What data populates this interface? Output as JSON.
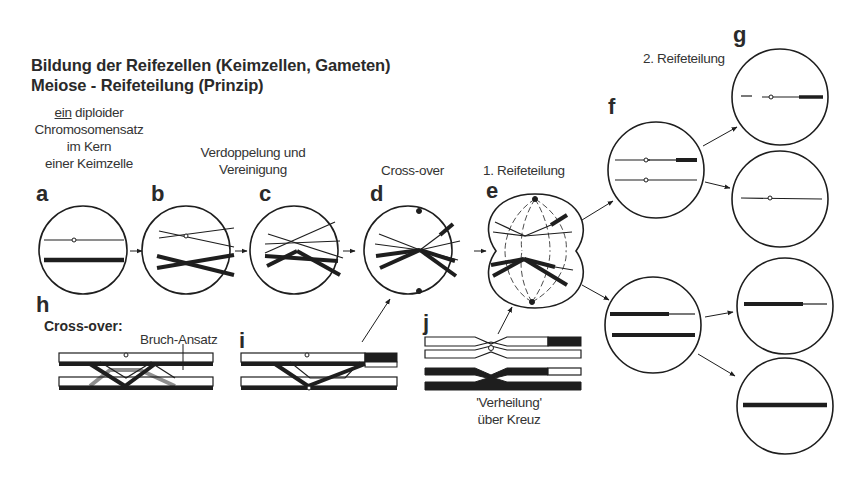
{
  "title": {
    "line1": "Bildung der Reifezellen (Keimzellen, Gameten)",
    "line2": "Meiose  -  Reifeteilung (Prinzip)"
  },
  "captions": {
    "a_line1_underlined": "ein",
    "a_line1_rest": " diploider",
    "a_line2": "Chromosomensatz",
    "a_line3": "im Kern",
    "a_line4": "einer Keimzelle",
    "c_line1": "Verdoppelung und",
    "c_line2": "Vereinigung",
    "d": "Cross-over",
    "e": "1. Reifeteilung",
    "g": "2. Reifeteilung",
    "h": "Cross-over:",
    "h_annotation": "Bruch-Ansatz",
    "j_line1": "'Verheilung'",
    "j_line2": "über Kreuz"
  },
  "labels": {
    "a": "a",
    "b": "b",
    "c": "c",
    "d": "d",
    "e": "e",
    "f": "f",
    "g": "g",
    "h": "h",
    "i": "i",
    "j": "j"
  },
  "colors": {
    "ink": "#1e1e1e",
    "paper": "#ffffff"
  }
}
